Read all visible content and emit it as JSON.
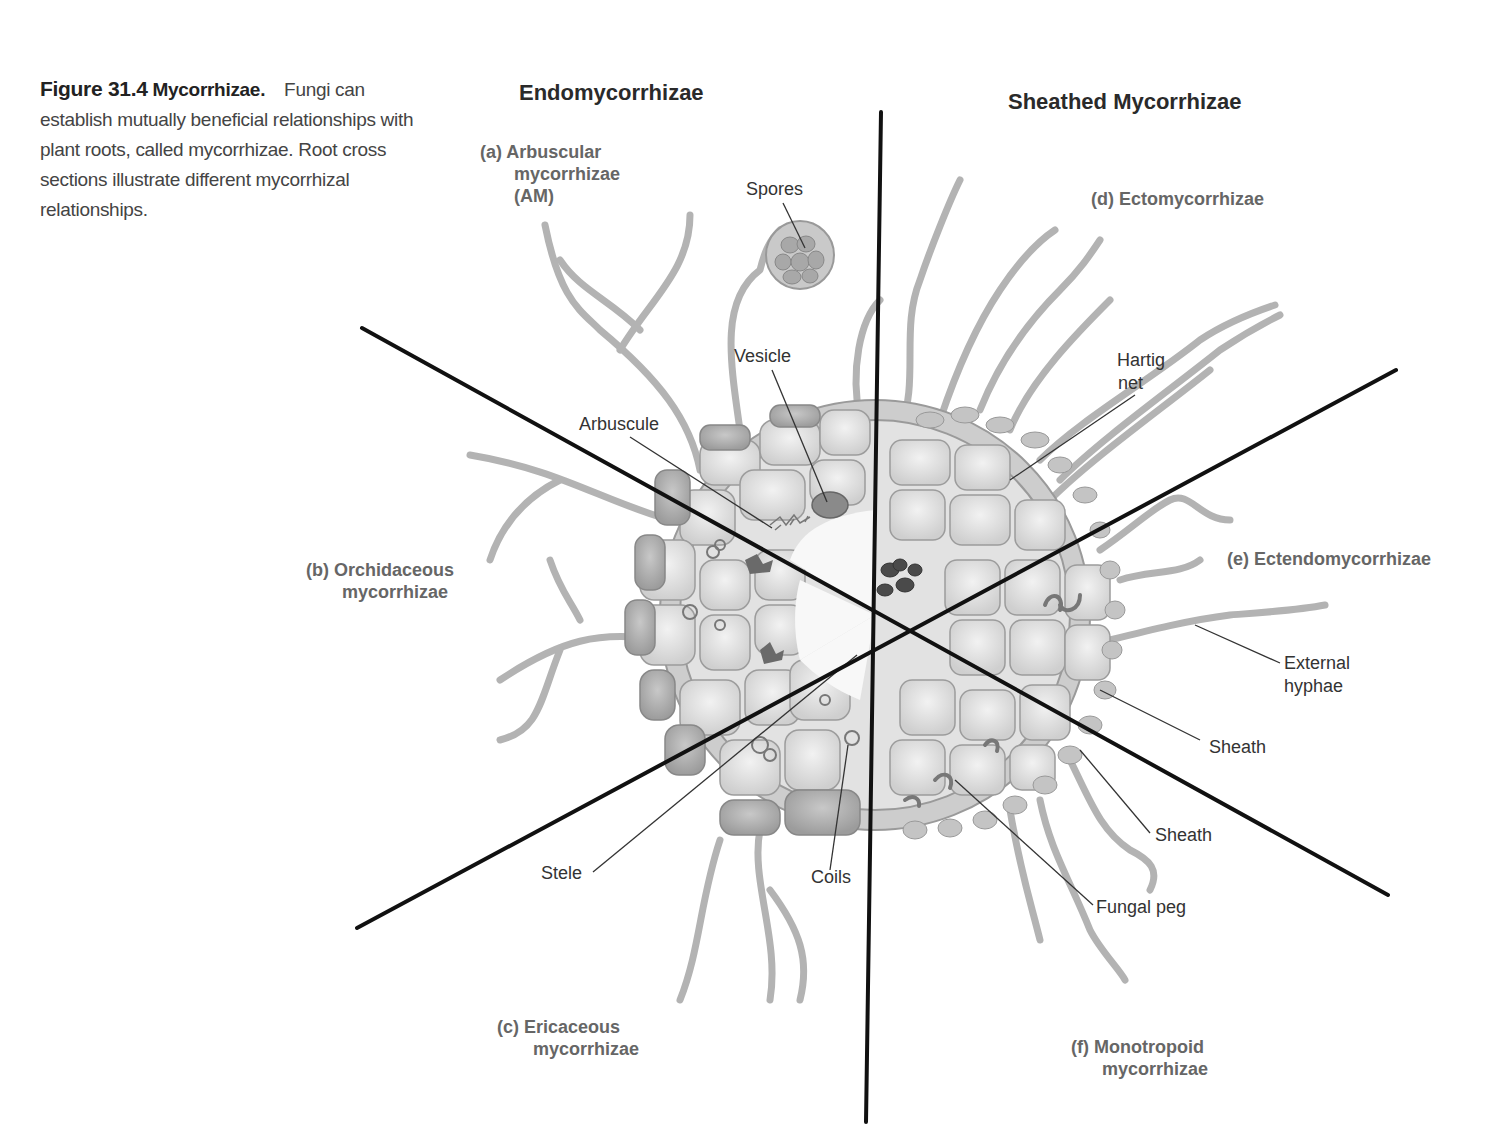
{
  "caption": {
    "figure_number": "Figure 31.4",
    "title": "Mycorrhizae.",
    "body": "Fungi can establish mutually beneficial relationships with plant roots, called mycorrhizae. Root cross sections illustrate different mycorrhizal relationships."
  },
  "headers": {
    "left": "Endomycorrhizae",
    "right": "Sheathed Mycorrhizae"
  },
  "sections": {
    "a": {
      "line1": "(a) Arbuscular",
      "line2": "mycorrhizae",
      "line3": "(AM)"
    },
    "b": {
      "line1": "(b) Orchidaceous",
      "line2": "mycorrhizae"
    },
    "c": {
      "line1": "(c) Ericaceous",
      "line2": "mycorrhizae"
    },
    "d": {
      "line1": "(d) Ectomycorrhizae"
    },
    "e": {
      "line1": "(e) Ectendomycorrhizae"
    },
    "f": {
      "line1": "(f) Monotropoid",
      "line2": "mycorrhizae"
    }
  },
  "labels": {
    "spores": "Spores",
    "vesicle": "Vesicle",
    "arbuscule": "Arbuscule",
    "hartig_line1": "Hartig",
    "hartig_line2": "net",
    "external_line1": "External",
    "external_line2": "hyphae",
    "sheath_e": "Sheath",
    "sheath_f": "Sheath",
    "fungal_peg": "Fungal peg",
    "stele": "Stele",
    "coils": "Coils"
  },
  "colors": {
    "divider": "#111111",
    "cell_fill": "#e4e4e4",
    "cell_stroke": "#9a9a9a",
    "hypha": "#b8b8b8",
    "section_label": "#666666"
  }
}
